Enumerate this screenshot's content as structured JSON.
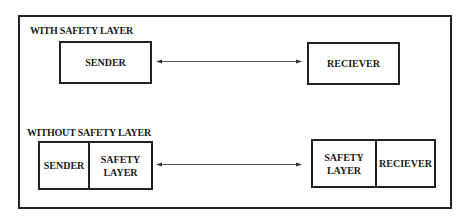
{
  "diagram": {
    "with_section": {
      "label": "WITH SAFETY LAYER",
      "sender": "SENDER",
      "receiver": "RECIEVER",
      "connector": "bidirectional-arrow"
    },
    "without_section": {
      "label": "WITHOUT SAFETY LAYER",
      "left_box": {
        "sender": "SENDER",
        "safety_line1": "SAFETY",
        "safety_line2": "LAYER"
      },
      "right_box": {
        "safety_line1": "SAFETY",
        "safety_line2": "LAYER",
        "receiver": "RECIEVER"
      },
      "connector": "bidirectional-arrow"
    }
  },
  "colors": {
    "stroke": "#222222",
    "arrow": "#555555",
    "background": "#ffffff"
  }
}
